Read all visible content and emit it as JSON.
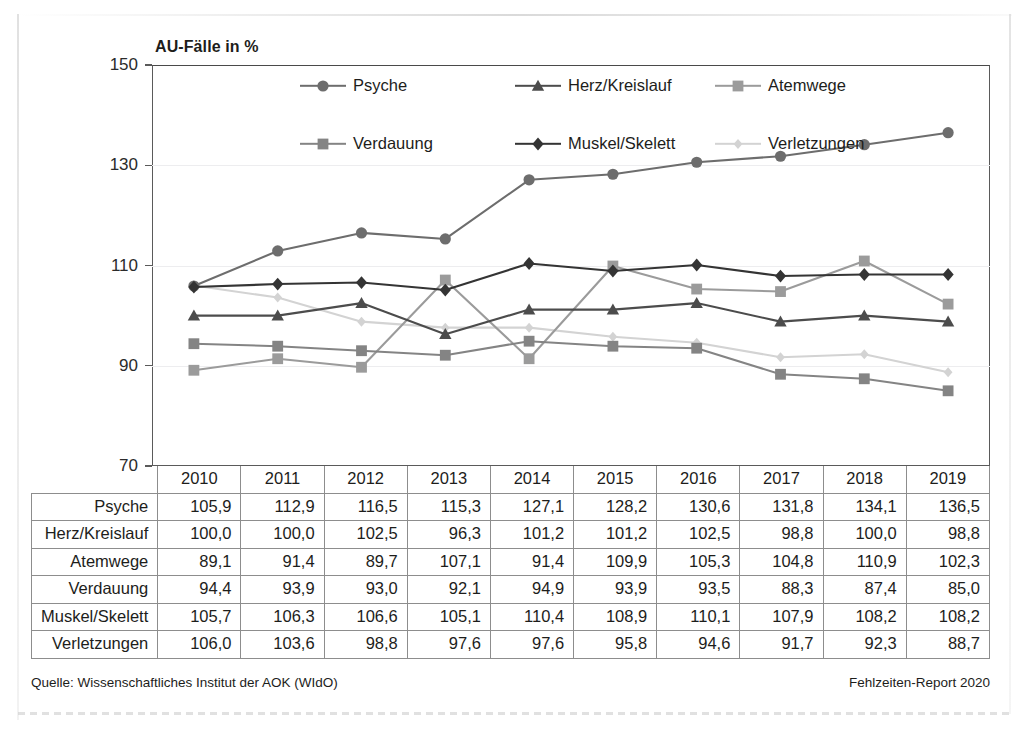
{
  "chart_data": {
    "type": "line",
    "title": "AU-Fälle in %",
    "xlabel": "",
    "ylabel": "",
    "ylim": [
      70,
      150
    ],
    "yticks": [
      70,
      90,
      110,
      130,
      150
    ],
    "grid": true,
    "legend_position": "top-center",
    "categories": [
      "2010",
      "2011",
      "2012",
      "2013",
      "2014",
      "2015",
      "2016",
      "2017",
      "2018",
      "2019"
    ],
    "series": [
      {
        "name": "Psyche",
        "marker": "circle",
        "color": "#6d6d6d",
        "values": [
          105.9,
          112.9,
          116.5,
          115.3,
          127.1,
          128.2,
          130.6,
          131.8,
          134.1,
          136.5
        ]
      },
      {
        "name": "Herz/Kreislauf",
        "marker": "triangle",
        "color": "#4c4c4c",
        "values": [
          100.0,
          100.0,
          102.5,
          96.3,
          101.2,
          101.2,
          102.5,
          98.8,
          100.0,
          98.8
        ]
      },
      {
        "name": "Atemwege",
        "marker": "square",
        "color": "#9b9b9b",
        "values": [
          89.1,
          91.4,
          89.7,
          107.1,
          91.4,
          109.9,
          105.3,
          104.8,
          110.9,
          102.3
        ]
      },
      {
        "name": "Verdauung",
        "marker": "square",
        "color": "#848484",
        "values": [
          94.4,
          93.9,
          93.0,
          92.1,
          94.9,
          93.9,
          93.5,
          88.3,
          87.4,
          85.0
        ]
      },
      {
        "name": "Muskel/Skelett",
        "marker": "diamond",
        "color": "#343434",
        "values": [
          105.7,
          106.3,
          106.6,
          105.1,
          110.4,
          108.9,
          110.1,
          107.9,
          108.2,
          108.2
        ]
      },
      {
        "name": "Verletzungen",
        "marker": "small-diamond",
        "color": "#d3d3d3",
        "values": [
          106.0,
          103.6,
          98.8,
          97.6,
          97.6,
          95.8,
          94.6,
          91.7,
          92.3,
          88.7
        ]
      }
    ]
  },
  "table": {
    "corner_label": "",
    "column_headers": [
      "2010",
      "2011",
      "2012",
      "2013",
      "2014",
      "2015",
      "2016",
      "2017",
      "2018",
      "2019"
    ],
    "rows": [
      {
        "label": "Psyche",
        "cells": [
          "105,9",
          "112,9",
          "116,5",
          "115,3",
          "127,1",
          "128,2",
          "130,6",
          "131,8",
          "134,1",
          "136,5"
        ]
      },
      {
        "label": "Herz/Kreislauf",
        "cells": [
          "100,0",
          "100,0",
          "102,5",
          "96,3",
          "101,2",
          "101,2",
          "102,5",
          "98,8",
          "100,0",
          "98,8"
        ]
      },
      {
        "label": "Atemwege",
        "cells": [
          "89,1",
          "91,4",
          "89,7",
          "107,1",
          "91,4",
          "109,9",
          "105,3",
          "104,8",
          "110,9",
          "102,3"
        ]
      },
      {
        "label": "Verdauung",
        "cells": [
          "94,4",
          "93,9",
          "93,0",
          "92,1",
          "94,9",
          "93,9",
          "93,5",
          "88,3",
          "87,4",
          "85,0"
        ]
      },
      {
        "label": "Muskel/Skelett",
        "cells": [
          "105,7",
          "106,3",
          "106,6",
          "105,1",
          "110,4",
          "108,9",
          "110,1",
          "107,9",
          "108,2",
          "108,2"
        ]
      },
      {
        "label": "Verletzungen",
        "cells": [
          "106,0",
          "103,6",
          "98,8",
          "97,6",
          "97,6",
          "95,8",
          "94,6",
          "91,7",
          "92,3",
          "88,7"
        ]
      }
    ]
  },
  "footer": {
    "source": "Quelle: Wissenschaftliches Institut der AOK (WIdO)",
    "report": "Fehlzeiten-Report 2020"
  }
}
